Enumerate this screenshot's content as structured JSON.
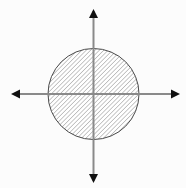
{
  "figure": {
    "title": "Hatched disk centered at the origin of a coordinate plane",
    "canvas": {
      "width": 186,
      "height": 188,
      "background_color": "#fcfcfc"
    },
    "axes": {
      "name": "coordinate-axes",
      "color": "#8a8a8a",
      "stroke_width": 2,
      "arrowhead_color": "#111111",
      "origin": {
        "x": 93.5,
        "y": 94
      },
      "horizontal": {
        "label": "x-axis",
        "x_start": 13,
        "x_end": 178,
        "y": 94,
        "arrow_left": true,
        "arrow_right": true
      },
      "vertical": {
        "label": "y-axis",
        "x": 93.5,
        "y_start": 11,
        "y_end": 181,
        "arrow_up": true,
        "arrow_down": true
      },
      "arrowhead": {
        "length": 9,
        "half_width": 4.5
      }
    },
    "shape": {
      "name": "hatched-circle",
      "type": "circle",
      "center_x": 93.5,
      "center_y": 94,
      "radius": 45.5,
      "outline_color": "#4a4a4a",
      "outline_width": 1,
      "fill_style": "diagonal-hatch",
      "fill_background": "#ffffff"
    },
    "hatch": {
      "name": "diagonal-hatch-pattern",
      "direction": "backslash",
      "angle_degrees": 45,
      "line_color": "#7d7d7d",
      "line_width": 0.85,
      "spacing": 3.1
    }
  },
  "chart_data": {
    "type": "scatter",
    "title": "Hatched disk centered at the origin",
    "xlabel": "x",
    "ylabel": "y",
    "grid": false,
    "legend": null,
    "xlim": [
      -1.8,
      1.8
    ],
    "ylim": [
      -1.8,
      1.8
    ],
    "xticks": [],
    "yticks": [],
    "annotations": [
      {
        "kind": "region",
        "shape": "disk",
        "center": [
          0,
          0
        ],
        "radius": 1,
        "fill": "diagonal-hatch",
        "description": "Shaded disk of radius 1 centered at the origin"
      },
      {
        "kind": "axis",
        "shape": "double-arrow",
        "from": [
          -1.77,
          0
        ],
        "to": [
          1.85,
          0
        ],
        "description": "Horizontal axis with arrowheads on both ends"
      },
      {
        "kind": "axis",
        "shape": "double-arrow",
        "from": [
          0,
          -1.82
        ],
        "to": [
          0,
          1.82
        ],
        "description": "Vertical axis with arrowheads on both ends"
      }
    ]
  }
}
